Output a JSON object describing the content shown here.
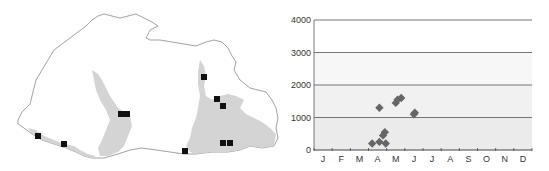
{
  "map": {
    "description": "Outline map with shaded river valleys and sample site markers",
    "outline_color": "#8a8a8a",
    "valley_color": "#d4d4d4",
    "marker_color": "#111111",
    "markers": [
      {
        "x": 38,
        "y": 136
      },
      {
        "x": 64,
        "y": 144
      },
      {
        "x": 121,
        "y": 114
      },
      {
        "x": 127,
        "y": 114
      },
      {
        "x": 185,
        "y": 151
      },
      {
        "x": 204,
        "y": 77
      },
      {
        "x": 217,
        "y": 99
      },
      {
        "x": 223,
        "y": 106
      },
      {
        "x": 223,
        "y": 143
      },
      {
        "x": 230,
        "y": 143
      }
    ]
  },
  "chart_data": {
    "type": "scatter",
    "title": "",
    "xlabel": "",
    "ylabel": "",
    "categories": [
      "J",
      "F",
      "M",
      "A",
      "M",
      "J",
      "J",
      "A",
      "S",
      "O",
      "N",
      "D"
    ],
    "yticks": [
      0,
      1000,
      2000,
      3000,
      4000
    ],
    "ylim": [
      0,
      4000
    ],
    "grid": true,
    "legend": null,
    "marker": "diamond",
    "marker_color": "#666666",
    "background_bands": [
      {
        "from": 0,
        "to": 1000,
        "color": "#ebebeb"
      },
      {
        "from": 1000,
        "to": 2000,
        "color": "#f1f1f1"
      },
      {
        "from": 2000,
        "to": 3000,
        "color": "#f7f7f7"
      },
      {
        "from": 3000,
        "to": 4000,
        "color": "#ffffff"
      }
    ],
    "points": [
      {
        "month": 3.7,
        "value": 200
      },
      {
        "month": 4.1,
        "value": 250
      },
      {
        "month": 4.45,
        "value": 200
      },
      {
        "month": 4.3,
        "value": 450
      },
      {
        "month": 4.4,
        "value": 550
      },
      {
        "month": 4.1,
        "value": 1300
      },
      {
        "month": 5.0,
        "value": 1450
      },
      {
        "month": 5.1,
        "value": 1550
      },
      {
        "month": 5.3,
        "value": 1600
      },
      {
        "month": 6.0,
        "value": 1100
      },
      {
        "month": 6.05,
        "value": 1150
      }
    ]
  }
}
